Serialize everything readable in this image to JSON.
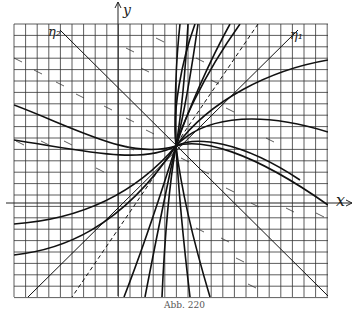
{
  "figure": {
    "caption": "Abb. 220",
    "axes": {
      "x_label": "x",
      "y_label": "y"
    },
    "line_labels": {
      "left_diagonal": "η₂",
      "right_diagonal": "η₁"
    },
    "colors": {
      "ink": "#222222",
      "grid": "#333333",
      "background": "#ffffff"
    }
  }
}
